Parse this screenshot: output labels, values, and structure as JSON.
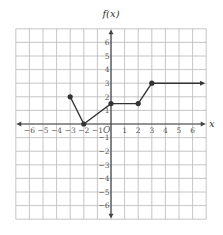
{
  "chart_data": {
    "type": "line",
    "title": "f(x)",
    "xlabel": "x",
    "ylabel": "f(x)",
    "origin_label": "O",
    "xlim": [
      -7,
      7
    ],
    "ylim": [
      -7,
      7
    ],
    "grid": true,
    "x_ticks": [
      "−6",
      "−5",
      "−4",
      "−3",
      "−2",
      "−1",
      "1",
      "2",
      "3",
      "4",
      "5",
      "6"
    ],
    "y_ticks": [
      "6",
      "5",
      "4",
      "3",
      "2",
      "1",
      "−1",
      "−2",
      "−3",
      "−4",
      "−5",
      "−6"
    ],
    "series": [
      {
        "name": "f(x)",
        "points": [
          [
            -3,
            2
          ],
          [
            -2,
            0
          ],
          [
            0,
            1.5
          ],
          [
            2,
            1.5
          ],
          [
            3,
            3
          ]
        ],
        "ray_end": [
          6.7,
          3
        ],
        "closed_endpoints": [
          [
            -3,
            2
          ],
          [
            -2,
            0
          ],
          [
            0,
            1.5
          ],
          [
            2,
            1.5
          ],
          [
            3,
            3
          ]
        ],
        "ends_with_arrow": true
      }
    ]
  },
  "colors": {
    "grid": "#b8b8b8",
    "axis": "#444444",
    "curve": "#333333"
  }
}
